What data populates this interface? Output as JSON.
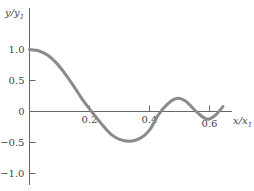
{
  "chart_data": {
    "type": "line",
    "title": "",
    "xlabel": "x/x1",
    "ylabel": "y/y1",
    "xlabel_main": "x/x",
    "xlabel_sub": "1",
    "ylabel_main": "y/y",
    "ylabel_sub": "1",
    "xlim": [
      0,
      0.66
    ],
    "ylim": [
      -1.1,
      1.3
    ],
    "x_ticks": [
      0.2,
      0.4,
      0.6
    ],
    "x_tick_labels": [
      "0.2",
      "0.4",
      "0.6"
    ],
    "y_ticks": [
      1.0,
      0.5,
      0,
      -0.5,
      -1.0
    ],
    "y_tick_labels": [
      "1.0",
      "0.5",
      "0",
      "−0.5",
      "−1.0"
    ],
    "grid": false,
    "legend": null,
    "series": [
      {
        "name": "y/y1",
        "color": "#8a8a8a",
        "x": [
          0.0,
          0.03,
          0.06,
          0.09,
          0.12,
          0.15,
          0.18,
          0.207,
          0.24,
          0.27,
          0.3,
          0.335,
          0.37,
          0.4,
          0.43,
          0.46,
          0.49,
          0.52,
          0.545,
          0.565,
          0.585,
          0.6,
          0.62,
          0.645
        ],
        "values": [
          1.0,
          0.98,
          0.91,
          0.78,
          0.6,
          0.39,
          0.17,
          0.0,
          -0.2,
          -0.36,
          -0.45,
          -0.48,
          -0.43,
          -0.3,
          -0.05,
          0.12,
          0.21,
          0.17,
          0.05,
          -0.04,
          -0.11,
          -0.12,
          -0.06,
          0.08
        ]
      }
    ]
  }
}
